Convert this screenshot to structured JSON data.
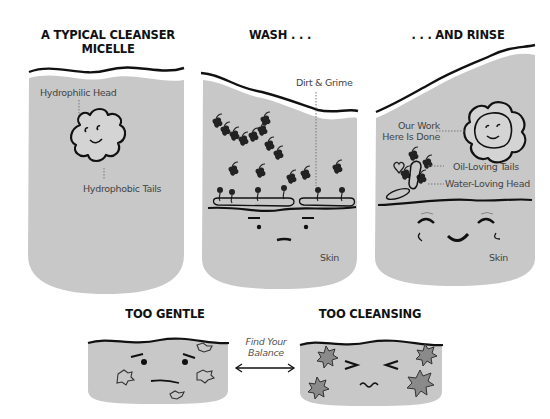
{
  "colors": {
    "panel_fill": "#c8c8c8",
    "ink": "#111111",
    "label_text": "#444444",
    "star_fill": "#8a8a8a",
    "background": "#ffffff"
  },
  "panels": [
    {
      "id": "micelle",
      "title_line1": "A TYPICAL CLEANSER",
      "title_line2": "MICELLE",
      "labels": {
        "head": "Hydrophilic Head",
        "tails": "Hydrophobic Tails"
      }
    },
    {
      "id": "wash",
      "title": "WASH . . .",
      "labels": {
        "dirt": "Dirt & Grime",
        "skin": "Skin"
      }
    },
    {
      "id": "rinse",
      "title": ". . . AND RINSE",
      "labels": {
        "done_line1": "Our Work",
        "done_line2": "Here Is Done",
        "oil_tails": "Oil-Loving Tails",
        "water_head": "Water-Loving Head",
        "skin": "Skin"
      }
    }
  ],
  "bottom": {
    "too_gentle": {
      "title": "TOO GENTLE"
    },
    "too_cleansing": {
      "title": "TOO CLEANSING"
    },
    "balance": {
      "line1": "Find Your",
      "line2": "Balance"
    }
  }
}
